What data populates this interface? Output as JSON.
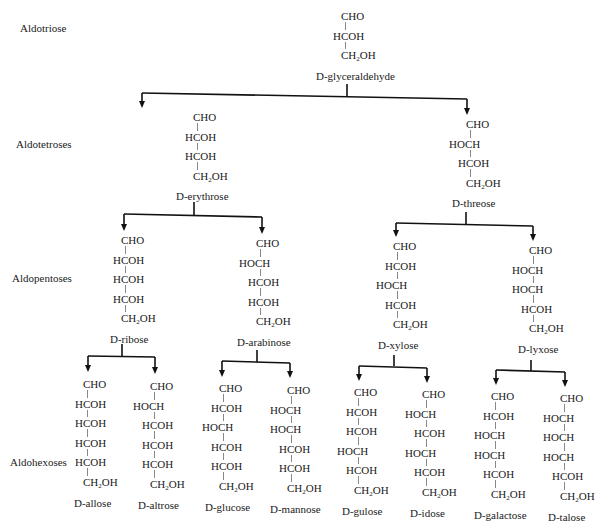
{
  "levels": [
    {
      "label": "Aldotriose",
      "x": 20,
      "y": 22
    },
    {
      "label": "Aldotetroses",
      "x": 16,
      "y": 138
    },
    {
      "label": "Aldopentoses",
      "x": 12,
      "y": 272
    },
    {
      "label": "Aldohexoses",
      "x": 10,
      "y": 456
    }
  ],
  "molecules": [
    {
      "id": "glyceraldehyde",
      "name": "D-glyceraldehyde",
      "level": "Aldotriose",
      "x": 345,
      "y": 10,
      "groups": [
        "CHO",
        "HCOH",
        "CH2OH"
      ],
      "name_x": 316
    },
    {
      "id": "erythrose",
      "name": "D-erythrose",
      "level": "Aldotetroses",
      "x": 197,
      "y": 111,
      "groups": [
        "CHO",
        "HCOH",
        "HCOH",
        "CH2OH"
      ],
      "name_x": 176
    },
    {
      "id": "threose",
      "name": "D-threose",
      "level": "Aldotetroses",
      "x": 470,
      "y": 118,
      "groups": [
        "CHO",
        "HOCH",
        "HCOH",
        "CH2OH"
      ],
      "name_x": 452
    },
    {
      "id": "ribose",
      "name": "D-ribose",
      "level": "Aldopentoses",
      "x": 125,
      "y": 234,
      "groups": [
        "CHO",
        "HCOH",
        "HCOH",
        "HCOH",
        "CH2OH"
      ],
      "name_x": 110
    },
    {
      "id": "arabinose",
      "name": "D-arabinose",
      "level": "Aldopentoses",
      "x": 260,
      "y": 237,
      "groups": [
        "CHO",
        "HOCH",
        "HCOH",
        "HCOH",
        "CH2OH"
      ],
      "name_x": 237
    },
    {
      "id": "xylose",
      "name": "D-xylose",
      "level": "Aldopentoses",
      "x": 397,
      "y": 240,
      "groups": [
        "CHO",
        "HCOH",
        "HOCH",
        "HCOH",
        "CH2OH"
      ],
      "name_x": 378
    },
    {
      "id": "lyxose",
      "name": "D-lyxose",
      "level": "Aldopentoses",
      "x": 533,
      "y": 244,
      "groups": [
        "CHO",
        "HOCH",
        "HOCH",
        "HCOH",
        "CH2OH"
      ],
      "name_x": 518
    },
    {
      "id": "allose",
      "name": "D-allose",
      "level": "Aldohexoses",
      "x": 87,
      "y": 378,
      "groups": [
        "CHO",
        "HCOH",
        "HCOH",
        "HCOH",
        "HCOH",
        "CH2OH"
      ],
      "name_x": 74
    },
    {
      "id": "altrose",
      "name": "D-altrose",
      "level": "Aldohexoses",
      "x": 154,
      "y": 380,
      "groups": [
        "CHO",
        "HOCH",
        "HCOH",
        "HCOH",
        "HCOH",
        "CH2OH"
      ],
      "name_x": 138
    },
    {
      "id": "glucose",
      "name": "D-glucose",
      "level": "Aldohexoses",
      "x": 223,
      "y": 382,
      "groups": [
        "CHO",
        "HCOH",
        "HOCH",
        "HCOH",
        "HCOH",
        "CH2OH"
      ],
      "name_x": 205
    },
    {
      "id": "mannose",
      "name": "D-mannose",
      "level": "Aldohexoses",
      "x": 291,
      "y": 384,
      "groups": [
        "CHO",
        "HOCH",
        "HOCH",
        "HCOH",
        "HCOH",
        "CH2OH"
      ],
      "name_x": 270
    },
    {
      "id": "gulose",
      "name": "D-gulose",
      "level": "Aldohexoses",
      "x": 358,
      "y": 386,
      "groups": [
        "CHO",
        "HCOH",
        "HCOH",
        "HOCH",
        "HCOH",
        "CH2OH"
      ],
      "name_x": 342
    },
    {
      "id": "idose",
      "name": "D-idose",
      "level": "Aldohexoses",
      "x": 426,
      "y": 388,
      "groups": [
        "CHO",
        "HOCH",
        "HCOH",
        "HOCH",
        "HCOH",
        "CH2OH"
      ],
      "name_x": 410
    },
    {
      "id": "galactose",
      "name": "D-galactose",
      "level": "Aldohexoses",
      "x": 495,
      "y": 390,
      "groups": [
        "CHO",
        "HCOH",
        "HOCH",
        "HOCH",
        "HCOH",
        "CH2OH"
      ],
      "name_x": 474
    },
    {
      "id": "talose",
      "name": "D-talose",
      "level": "Aldohexoses",
      "x": 564,
      "y": 392,
      "groups": [
        "CHO",
        "HOCH",
        "HOCH",
        "HOCH",
        "HCOH",
        "CH2OH"
      ],
      "name_x": 548
    }
  ],
  "branches": [
    {
      "from": "glyceraldehyde",
      "stem": [
        347,
        84,
        347,
        97
      ],
      "bar": [
        142,
        93,
        467,
        99
      ],
      "left": [
        142,
        93,
        142,
        108
      ],
      "right": [
        467,
        99,
        467,
        115
      ]
    },
    {
      "from": "erythrose",
      "stem": [
        194,
        202,
        194,
        215
      ],
      "bar": [
        124,
        214,
        262,
        217
      ],
      "left": [
        124,
        214,
        124,
        231
      ],
      "right": [
        262,
        217,
        262,
        234
      ]
    },
    {
      "from": "threose",
      "stem": [
        466,
        212,
        466,
        224
      ],
      "bar": [
        396,
        223,
        533,
        226
      ],
      "left": [
        396,
        223,
        396,
        237
      ],
      "right": [
        533,
        226,
        533,
        241
      ]
    },
    {
      "from": "ribose",
      "stem": [
        122,
        344,
        122,
        357
      ],
      "bar": [
        88,
        356,
        155,
        357
      ],
      "left": [
        88,
        356,
        88,
        372
      ],
      "right": [
        155,
        357,
        155,
        374
      ]
    },
    {
      "from": "arabinose",
      "stem": [
        257,
        350,
        257,
        362
      ],
      "bar": [
        222,
        361,
        290,
        363
      ],
      "left": [
        222,
        361,
        222,
        377
      ],
      "right": [
        290,
        363,
        290,
        378
      ]
    },
    {
      "from": "xylose",
      "stem": [
        394,
        355,
        394,
        366
      ],
      "bar": [
        359,
        366,
        427,
        368
      ],
      "left": [
        359,
        366,
        359,
        381
      ],
      "right": [
        427,
        368,
        427,
        383
      ]
    },
    {
      "from": "lyxose",
      "stem": [
        531,
        360,
        531,
        371
      ],
      "bar": [
        496,
        370,
        565,
        372
      ],
      "left": [
        496,
        370,
        496,
        385
      ],
      "right": [
        565,
        372,
        565,
        387
      ]
    }
  ]
}
